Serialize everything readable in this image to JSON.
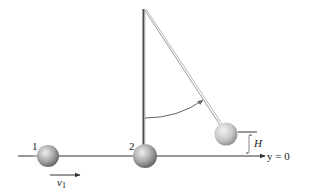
{
  "diagram": {
    "ball_labels": [
      "1",
      "2"
    ],
    "velocity_label": {
      "symbol": "v",
      "subscript": "1"
    },
    "height_label": "H",
    "reference_label": "y = 0",
    "colors": {
      "ball": "#9a9a9a",
      "ball_highlight": "#e6e6e6",
      "rod": "#555555",
      "string": "#8a8a8a",
      "line": "#333333",
      "arc": "#666666"
    }
  }
}
